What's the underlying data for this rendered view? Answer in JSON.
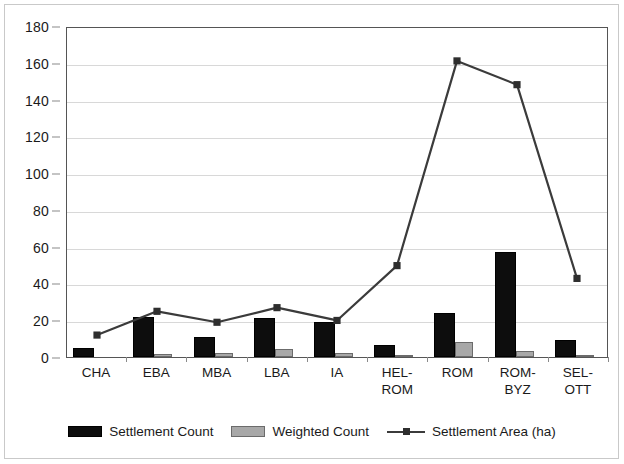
{
  "chart_data": {
    "type": "bar",
    "title": "",
    "subtitle": "",
    "xlabel": "",
    "ylabel": "",
    "ylim": [
      0,
      180
    ],
    "ytick_step": 20,
    "yticks": [
      0,
      20,
      40,
      60,
      80,
      100,
      120,
      140,
      160,
      180
    ],
    "ytick_labels": [
      "0",
      "20",
      "40",
      "60",
      "80",
      "100",
      "120",
      "140",
      "160",
      "180"
    ],
    "grid": "horizontal",
    "legend_position": "bottom-center",
    "categories": [
      "CHA",
      "EBA",
      "MBA",
      "LBA",
      "IA",
      "HEL-\nROM",
      "ROM",
      "ROM-\nBYZ",
      "SEL-\nOTT"
    ],
    "category_labels_flat": [
      "CHA",
      "EBA",
      "MBA",
      "LBA",
      "IA",
      "HEL-ROM",
      "ROM",
      "ROM-BYZ",
      "SEL-OTT"
    ],
    "series": [
      {
        "name": "Settlement Count",
        "type": "bar",
        "color": "#0d0d0d",
        "values": [
          5,
          22,
          11,
          21,
          19,
          6.5,
          24,
          57,
          9
        ]
      },
      {
        "name": "Weighted Count",
        "type": "bar",
        "color": "#a8a8a8",
        "values": [
          0,
          1.5,
          2,
          4.5,
          2,
          1,
          8,
          3,
          1
        ]
      },
      {
        "name": "Settlement Area (ha)",
        "type": "line",
        "color": "#3b3b3b",
        "marker": "square",
        "values": [
          12,
          25,
          19,
          27,
          20,
          50,
          162,
          149,
          43
        ]
      }
    ]
  },
  "legend": {
    "entries": [
      {
        "label": "Settlement Count",
        "swatch": "black-bar-swatch"
      },
      {
        "label": "Weighted Count",
        "swatch": "gray-bar-swatch"
      },
      {
        "label": "Settlement Area (ha)",
        "swatch": "line-marker-swatch"
      }
    ]
  }
}
